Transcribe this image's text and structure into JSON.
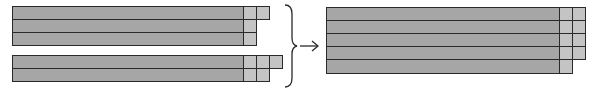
{
  "diagram": {
    "colors": {
      "bar": "#a6a6a6",
      "cell": "#c4c4c4",
      "stroke": "#2a2a2a"
    },
    "left_top_group": {
      "rows": 3,
      "extra_cells_per_row": [
        2,
        1,
        1
      ]
    },
    "left_bottom_group": {
      "rows": 2,
      "extra_cells_per_row": [
        3,
        2
      ]
    },
    "connector": {
      "brace": "right-curly-brace",
      "arrow": "right-arrow"
    },
    "right_group": {
      "rows": 5,
      "extra_cells_per_row": [
        2,
        2,
        2,
        2,
        1
      ]
    }
  }
}
